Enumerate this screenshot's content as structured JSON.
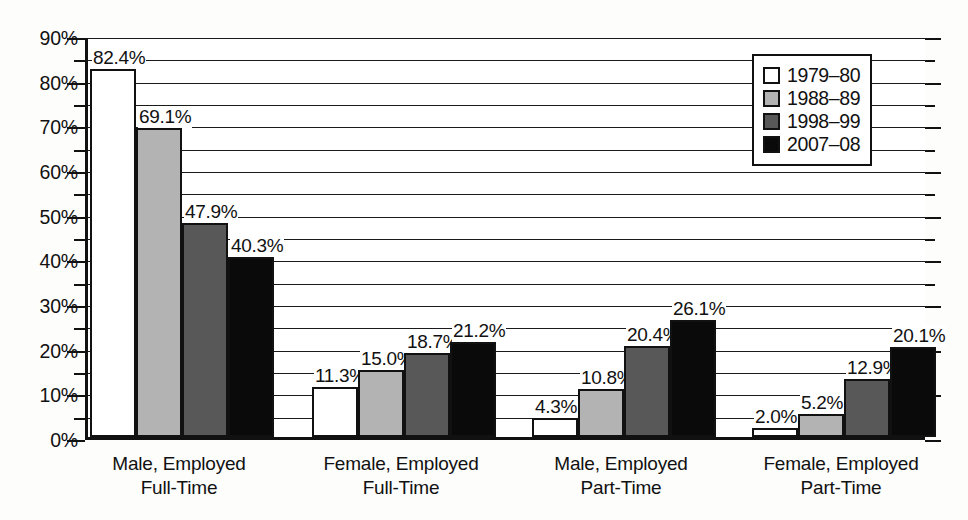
{
  "chart_data": {
    "type": "bar",
    "title": "",
    "xlabel": "",
    "ylabel": "",
    "ylim": [
      0,
      90
    ],
    "ytick_step": 10,
    "yminor_step": 5,
    "grid": true,
    "legend_position": "top-right",
    "categories": [
      "Male, Employed Full-Time",
      "Female, Employed Full-Time",
      "Male, Employed Part-Time",
      "Female, Employed Part-Time"
    ],
    "series": [
      {
        "name": "1979–80",
        "color": "#ffffff",
        "values": [
          82.4,
          11.3,
          4.3,
          2.0
        ]
      },
      {
        "name": "1988–89",
        "color": "#b3b3b3",
        "values": [
          69.1,
          15.0,
          10.8,
          5.2
        ]
      },
      {
        "name": "1998–99",
        "color": "#585858",
        "values": [
          47.9,
          18.7,
          20.4,
          12.9
        ]
      },
      {
        "name": "2007–08",
        "color": "#0a0a0a",
        "values": [
          40.3,
          21.2,
          26.1,
          20.1
        ]
      }
    ],
    "value_labels": [
      [
        "82.4%",
        "69.1%",
        "47.9%",
        "40.3%"
      ],
      [
        "11.3%",
        "15.0%",
        "18.7%",
        "21.2%"
      ],
      [
        "4.3%",
        "10.8%",
        "20.4%",
        "26.1%"
      ],
      [
        "2.0%",
        "5.2%",
        "12.9%",
        "20.1%"
      ]
    ],
    "ytick_labels": [
      "90%",
      "80%",
      "70%",
      "60%",
      "50%",
      "40%",
      "30%",
      "20%",
      "10%",
      "0%"
    ],
    "ytick_values": [
      90,
      80,
      70,
      60,
      50,
      40,
      30,
      20,
      10,
      0
    ]
  },
  "axis": {
    "y_labels": [
      "90%",
      "80%",
      "70%",
      "60%",
      "50%",
      "40%",
      "30%",
      "20%",
      "10%",
      "0%"
    ]
  },
  "groups": [
    {
      "line1": "Male, Employed",
      "line2": "Full-Time"
    },
    {
      "line1": "Female, Employed",
      "line2": "Full-Time"
    },
    {
      "line1": "Male, Employed",
      "line2": "Part-Time"
    },
    {
      "line1": "Female, Employed",
      "line2": "Part-Time"
    }
  ],
  "legend": {
    "items": [
      {
        "label": "1979–80",
        "swatch": "legend-swatch-white"
      },
      {
        "label": "1988–89",
        "swatch": "legend-swatch-light-gray"
      },
      {
        "label": "1998–99",
        "swatch": "legend-swatch-dark-gray"
      },
      {
        "label": "2007–08",
        "swatch": "legend-swatch-black"
      }
    ]
  }
}
